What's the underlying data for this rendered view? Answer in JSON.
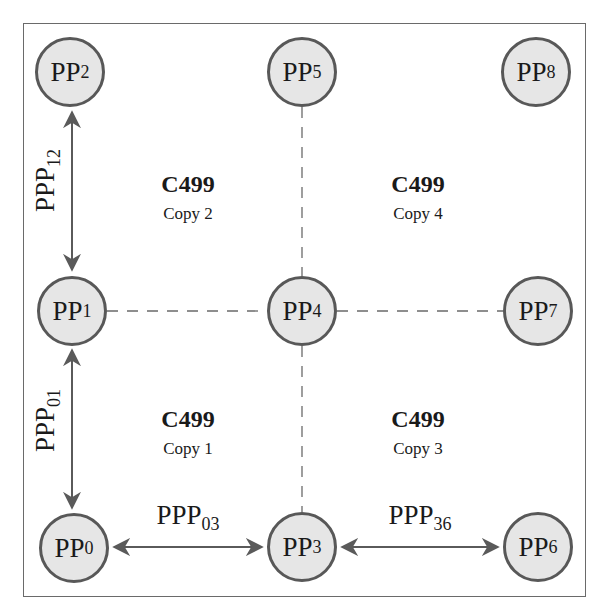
{
  "diagram": {
    "nodes": [
      {
        "id": "PP0",
        "base": "PP",
        "sub": "0",
        "x": 74,
        "y": 548
      },
      {
        "id": "PP1",
        "base": "PP",
        "sub": "1",
        "x": 72,
        "y": 311
      },
      {
        "id": "PP2",
        "base": "PP",
        "sub": "2",
        "x": 70,
        "y": 72
      },
      {
        "id": "PP3",
        "base": "PP",
        "sub": "3",
        "x": 302,
        "y": 547
      },
      {
        "id": "PP4",
        "base": "PP",
        "sub": "4",
        "x": 302,
        "y": 311
      },
      {
        "id": "PP5",
        "base": "PP",
        "sub": "5",
        "x": 302,
        "y": 72
      },
      {
        "id": "PP6",
        "base": "PP",
        "sub": "6",
        "x": 538,
        "y": 547
      },
      {
        "id": "PP7",
        "base": "PP",
        "sub": "7",
        "x": 538,
        "y": 311
      },
      {
        "id": "PP8",
        "base": "PP",
        "sub": "8",
        "x": 536,
        "y": 72
      }
    ],
    "regions": [
      {
        "title": "C499",
        "subtitle": "Copy 2",
        "x": 188,
        "y": 190
      },
      {
        "title": "C499",
        "subtitle": "Copy 4",
        "x": 418,
        "y": 190
      },
      {
        "title": "C499",
        "subtitle": "Copy 1",
        "x": 188,
        "y": 425
      },
      {
        "title": "C499",
        "subtitle": "Copy 3",
        "x": 418,
        "y": 425
      }
    ],
    "edge_labels": [
      {
        "base": "PPP",
        "sub": "12",
        "orientation": "vertical",
        "x": 45,
        "y": 180
      },
      {
        "base": "PPP",
        "sub": "01",
        "orientation": "vertical",
        "x": 45,
        "y": 420
      },
      {
        "base": "PPP",
        "sub": "03",
        "orientation": "horizontal",
        "x": 188,
        "y": 515
      },
      {
        "base": "PPP",
        "sub": "36",
        "orientation": "horizontal",
        "x": 420,
        "y": 515
      }
    ],
    "arrows": [
      {
        "from": "PP2",
        "to": "PP1",
        "x1": 72,
        "y1": 112,
        "x2": 72,
        "y2": 270
      },
      {
        "from": "PP1",
        "to": "PP0",
        "x1": 72,
        "y1": 350,
        "x2": 72,
        "y2": 508
      },
      {
        "from": "PP0",
        "to": "PP3",
        "x1": 114,
        "y1": 547,
        "x2": 262,
        "y2": 547
      },
      {
        "from": "PP3",
        "to": "PP6",
        "x1": 342,
        "y1": 547,
        "x2": 498,
        "y2": 547
      }
    ],
    "dashed_lines": [
      {
        "x1": 107,
        "y1": 311,
        "x2": 267,
        "y2": 311
      },
      {
        "x1": 337,
        "y1": 311,
        "x2": 503,
        "y2": 311
      },
      {
        "x1": 302,
        "y1": 107,
        "x2": 302,
        "y2": 276
      },
      {
        "x1": 302,
        "y1": 346,
        "x2": 302,
        "y2": 512
      }
    ],
    "colors": {
      "node_fill": "#e6e6e6",
      "node_stroke": "#585858",
      "line": "#6a6a6a",
      "text": "#1a1a1a"
    }
  }
}
